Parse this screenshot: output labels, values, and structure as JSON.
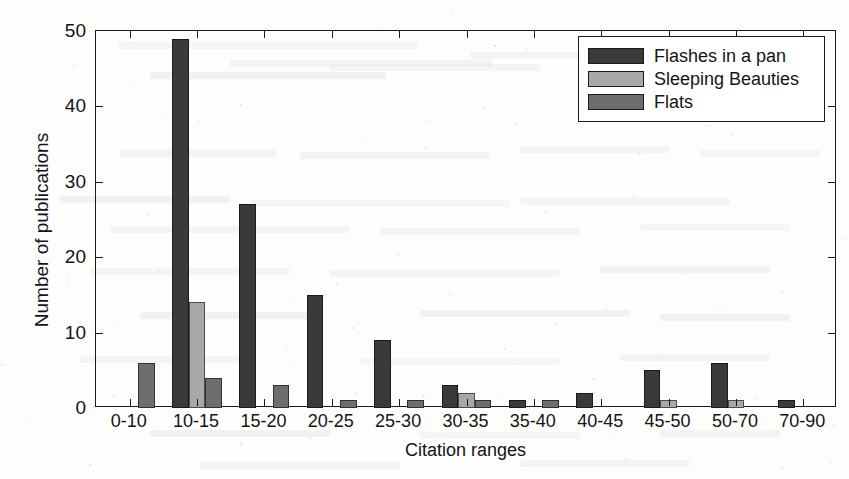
{
  "chart_data": {
    "type": "bar",
    "title": "",
    "xlabel": "Citation ranges",
    "ylabel": "Number of publications",
    "ylim": [
      0,
      50
    ],
    "yticks": [
      0,
      10,
      20,
      30,
      40,
      50
    ],
    "grid": false,
    "legend_position": "top-right",
    "categories": [
      "0-10",
      "10-15",
      "15-20",
      "20-25",
      "25-30",
      "30-35",
      "35-40",
      "40-45",
      "45-50",
      "50-70",
      "70-90"
    ],
    "series": [
      {
        "name": "Flashes in a pan",
        "color": "#3a3a3a",
        "values": [
          0,
          49,
          27,
          15,
          9,
          3,
          1,
          2,
          5,
          6,
          1
        ]
      },
      {
        "name": "Sleeping Beauties",
        "color": "#a8a8a8",
        "values": [
          0,
          14,
          0,
          0,
          0,
          2,
          0,
          0,
          1,
          1,
          0
        ]
      },
      {
        "name": "Flats",
        "color": "#6e6e6e",
        "values": [
          6,
          4,
          3,
          1,
          1,
          1,
          1,
          0,
          0,
          0,
          0
        ]
      }
    ]
  },
  "axis": {
    "y_tick_labels": [
      "0",
      "10",
      "20",
      "30",
      "40",
      "50"
    ],
    "x_tick_labels": [
      "0-10",
      "10-15",
      "15-20",
      "20-25",
      "25-30",
      "30-35",
      "35-40",
      "40-45",
      "45-50",
      "50-70",
      "70-90"
    ],
    "y_axis_title": "Number of publications",
    "x_axis_title": "Citation ranges"
  },
  "legend": {
    "entries": [
      {
        "label": "Flashes in a pan",
        "color": "#3a3a3a"
      },
      {
        "label": "Sleeping Beauties",
        "color": "#a8a8a8"
      },
      {
        "label": "Flats",
        "color": "#6e6e6e"
      }
    ]
  }
}
